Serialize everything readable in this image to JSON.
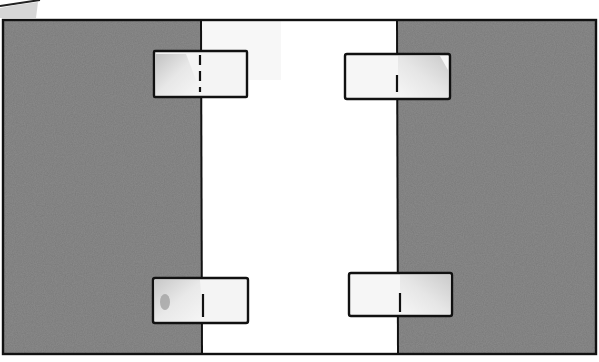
{
  "diagram": {
    "colors": {
      "background": "#ffffff",
      "panel_gray": "#8c8c8c",
      "panel_gray_light": "#a3a3a3",
      "outline": "#111111",
      "tape_fill": "#f2f2f2",
      "tape_shade": "#c9c9c9"
    },
    "frame": {
      "x": 3,
      "y": 20,
      "width": 593,
      "height": 334
    },
    "panels": [
      {
        "id": "left-panel",
        "x": 3,
        "y": 20,
        "width": 198,
        "height": 334,
        "fill": "gray"
      },
      {
        "id": "center-strip",
        "x": 201,
        "y": 20,
        "width": 196,
        "height": 334,
        "fill": "white"
      },
      {
        "id": "right-panel",
        "x": 397,
        "y": 20,
        "width": 199,
        "height": 334,
        "fill": "gray"
      }
    ],
    "seams": [
      {
        "id": "left-seam",
        "x": 201
      },
      {
        "id": "right-seam",
        "x": 397
      }
    ],
    "tapes": [
      {
        "id": "tape-top-left",
        "x": 154,
        "y": 51,
        "width": 93,
        "height": 46,
        "seam_x": 200,
        "mark": "dashed"
      },
      {
        "id": "tape-top-right",
        "x": 345,
        "y": 54,
        "width": 105,
        "height": 45,
        "seam_x": 397,
        "mark": "tick"
      },
      {
        "id": "tape-bottom-left",
        "x": 153,
        "y": 278,
        "width": 95,
        "height": 45,
        "seam_x": 203,
        "mark": "tick"
      },
      {
        "id": "tape-bottom-right",
        "x": 349,
        "y": 273,
        "width": 103,
        "height": 43,
        "seam_x": 400,
        "mark": "tick"
      }
    ]
  }
}
